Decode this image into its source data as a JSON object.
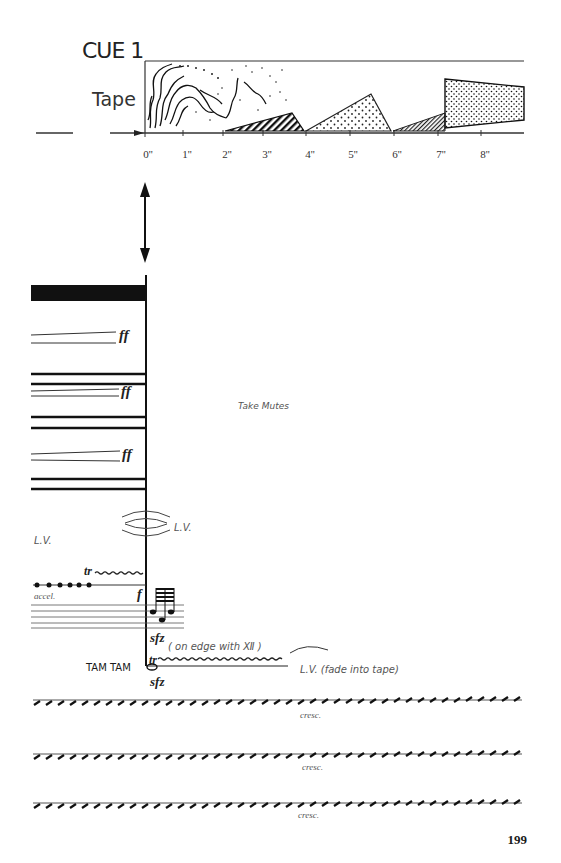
{
  "header": {
    "cue_title": "CUE 1",
    "tape_label": "Tape"
  },
  "timeline": {
    "ticks": [
      "0''",
      "1''",
      "2''",
      "3''",
      "4''",
      "5''",
      "6''",
      "7''",
      "8''"
    ]
  },
  "score": {
    "dynamics": {
      "ff_1": "ff",
      "ff_2": "ff",
      "ff_3": "ff",
      "f": "f",
      "sfz_1": "sfz",
      "sfz_2": "sfz"
    },
    "take_mutes": "Take Mutes",
    "lv_left": "L.V.",
    "lv_right": "L.V.",
    "trill_1": "tr",
    "trill_2": "tr",
    "accel": "accel.",
    "on_edge": "( on edge with Ⅻ )",
    "tam_tam": "TAM TAM",
    "lv_fade": "L.V. (fade into tape)",
    "cresc": [
      "cresc.",
      "cresc.",
      "cresc."
    ]
  },
  "page_number": "199"
}
